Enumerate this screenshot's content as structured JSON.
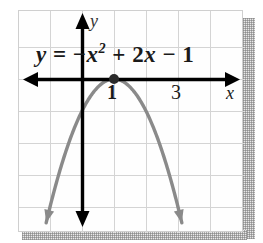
{
  "figure": {
    "kind": "coordinate-plane-graph",
    "width": 263,
    "height": 243,
    "background_color": "#ffffff"
  },
  "equation": {
    "lead": "y",
    "equals": "=",
    "term_quadratic_sign": "−",
    "term_quadratic_base": "x",
    "term_quadratic_exponent": "2",
    "term_linear": "+ 2x",
    "term_constant": "− 1",
    "full_text": "y = −x² + 2x − 1"
  },
  "axes": {
    "x_label": "x",
    "y_label": "y",
    "axis_color": "#000000",
    "origin_px": {
      "x": 81,
      "y": 78
    },
    "unit_px": 32,
    "x_range": [
      -2.0,
      5.0
    ],
    "y_range": [
      -4.8,
      2.1
    ],
    "grid": {
      "visible": true,
      "color": "#d2d2d2",
      "spacing_units": 1
    }
  },
  "ticks": [
    {
      "label": "1",
      "value": 1,
      "axis": "x",
      "emphasis": "bold"
    },
    {
      "label": "3",
      "value": 3,
      "axis": "x",
      "emphasis": "normal"
    }
  ],
  "chart_data": {
    "type": "line",
    "xlabel": "x",
    "ylabel": "y",
    "xlim": [
      -2.0,
      5.0
    ],
    "ylim": [
      -4.8,
      2.1
    ],
    "grid": true,
    "legend": "none",
    "curve_color": "#8a8a8a",
    "series": [
      {
        "name": "y = −x² + 2x − 1",
        "equation": "y = -x^2 + 2x - 1",
        "form": "vertex",
        "vertex": {
          "x": 1,
          "y": 0
        },
        "opens": "down",
        "leading_coefficient": -1,
        "roots": [
          1
        ],
        "root_multiplicity": 2,
        "y_intercept": -1,
        "axis_of_symmetry": "x = 1",
        "x": [
          -1.0,
          -0.75,
          -0.5,
          -0.25,
          0.0,
          0.25,
          0.5,
          0.75,
          1.0,
          1.25,
          1.5,
          1.75,
          2.0,
          2.25,
          2.5,
          2.75,
          3.0
        ],
        "values": [
          -4.0,
          -3.0625,
          -2.25,
          -1.5625,
          -1.0,
          -0.5625,
          -0.25,
          -0.0625,
          0.0,
          -0.0625,
          -0.25,
          -0.5625,
          -1.0,
          -1.5625,
          -2.25,
          -3.0625,
          -4.0
        ],
        "endpoints_have_arrows": true
      }
    ],
    "annotations": [
      {
        "text": "1",
        "x": 1,
        "y": 0,
        "note": "x-intercept / vertex tick label"
      },
      {
        "text": "3",
        "x": 3,
        "y": 0,
        "note": "x-axis tick label"
      }
    ],
    "marked_points": [
      {
        "x": 1,
        "y": 0,
        "style": "filled-dot",
        "color": "#2a2a2a",
        "note": "vertex on x-axis"
      }
    ]
  }
}
